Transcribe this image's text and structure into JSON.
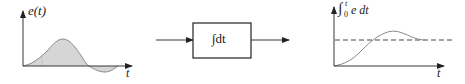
{
  "diagram": {
    "input_plot": {
      "y_label": "e(t)",
      "x_label": "t",
      "description": "error signal e(t) vs time: positive hump then small negative dip"
    },
    "block": {
      "label": "∫dt",
      "input_arrow": "in",
      "output_arrow": "out"
    },
    "output_plot": {
      "y_label_integral": "∫",
      "y_label_upper": "t",
      "y_label_lower": "0",
      "y_label_body": "e dt",
      "x_label": "t",
      "description": "integral of e over time: rises, overshoots, settles to dashed constant level"
    },
    "colors": {
      "axis": "#222222",
      "curve": "#8a8a8a",
      "fill": "#d6d6d6",
      "dashed": "#444444"
    }
  }
}
